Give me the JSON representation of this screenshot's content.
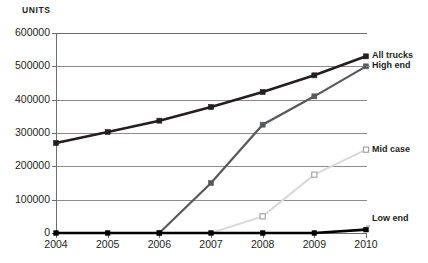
{
  "chart_data": {
    "type": "line",
    "title": "",
    "ylabel": "Units",
    "xlabel": "",
    "x": [
      2004,
      2005,
      2006,
      2007,
      2008,
      2009,
      2010
    ],
    "categories": [
      "2004",
      "2005",
      "2006",
      "2007",
      "2008",
      "2009",
      "2010"
    ],
    "ylim": [
      0,
      600000
    ],
    "xlim": [
      2004,
      2010
    ],
    "yticks": [
      0,
      100000,
      200000,
      300000,
      400000,
      500000,
      600000
    ],
    "ytick_labels": [
      "0",
      "100000",
      "200000",
      "300000",
      "400000",
      "500000",
      "600000"
    ],
    "grid": true,
    "legend_position": "right",
    "series": [
      {
        "name": "All trucks",
        "color": "#231f20",
        "marker": "filled-square",
        "values": [
          270000,
          303000,
          337000,
          378000,
          423000,
          473000,
          530000
        ]
      },
      {
        "name": "High end",
        "color": "#58595b",
        "marker": "filled-square",
        "values": [
          0,
          0,
          0,
          150000,
          325000,
          410000,
          500000
        ]
      },
      {
        "name": "Mid case",
        "color": "#d9d9d9",
        "marker": "open-square",
        "values": [
          0,
          0,
          0,
          0,
          50000,
          175000,
          250000
        ]
      },
      {
        "name": "Low end",
        "color": "#000000",
        "marker": "filled-square",
        "values": [
          0,
          0,
          0,
          0,
          0,
          0,
          10000
        ]
      }
    ]
  },
  "legend": {
    "items": [
      {
        "label": "All trucks"
      },
      {
        "label": "High end"
      },
      {
        "label": "Mid case"
      },
      {
        "label": "Low end"
      }
    ]
  },
  "colors": {
    "axis": "#6d6e71",
    "grid": "#8c8c8c",
    "text": "#231f20",
    "background": "#ffffff"
  }
}
